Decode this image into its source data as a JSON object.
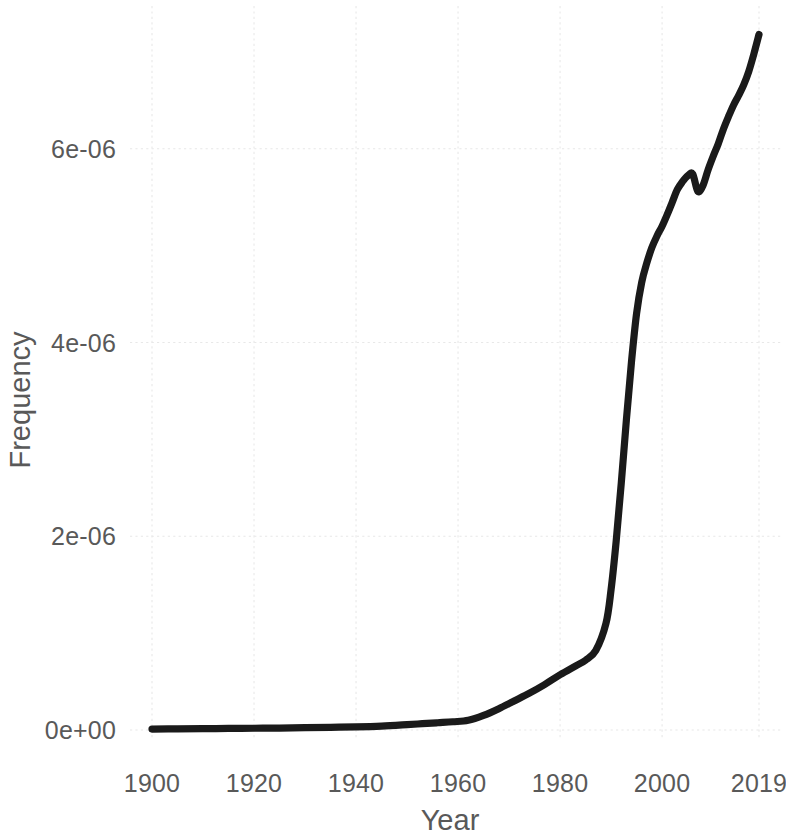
{
  "chart_data": {
    "type": "line",
    "title": "",
    "subtitle": "",
    "xlabel": "Year",
    "ylabel": "Frequency",
    "grid": true,
    "legend": false,
    "xlim": [
      1900,
      2019
    ],
    "ylim": [
      0,
      7.35e-06
    ],
    "xticks": [
      1900,
      1920,
      1940,
      1960,
      1980,
      2000,
      2019
    ],
    "xticklabels": [
      "1900",
      "1920",
      "1940",
      "1960",
      "1980",
      "2000",
      "2019"
    ],
    "yticks": [
      0,
      2e-06,
      4e-06,
      6e-06
    ],
    "yticklabels": [
      "0e+00",
      "2e-06",
      "4e-06",
      "6e-06"
    ],
    "line_color": "#1a1a1a",
    "grid_color": "#e8e8e8",
    "text_color": "#595959",
    "background_color": "#ffffff",
    "series": [
      {
        "name": "Frequency",
        "x": [
          1900,
          1905,
          1910,
          1915,
          1920,
          1925,
          1930,
          1935,
          1940,
          1945,
          1950,
          1953,
          1956,
          1959,
          1962,
          1965,
          1968,
          1971,
          1974,
          1977,
          1980,
          1983,
          1985,
          1987,
          1989,
          1990,
          1991,
          1992,
          1993,
          1994,
          1995,
          1996,
          1997,
          1998,
          1999,
          2000,
          2001,
          2002,
          2003,
          2004,
          2005,
          2006,
          2007,
          2008,
          2009,
          2010,
          2011,
          2012,
          2013,
          2014,
          2015,
          2016,
          2017,
          2018,
          2019
        ],
        "y": [
          1e-08,
          1.2e-08,
          1.4e-08,
          1.6e-08,
          1.8e-08,
          2e-08,
          2.4e-08,
          2.8e-08,
          3.2e-08,
          4e-08,
          5.5e-08,
          6.5e-08,
          7.5e-08,
          8.5e-08,
          1e-07,
          1.5e-07,
          2.2e-07,
          3e-07,
          3.8e-07,
          4.7e-07,
          5.7e-07,
          6.6e-07,
          7.2e-07,
          8.2e-07,
          1.1e-06,
          1.45e-06,
          1.95e-06,
          2.55e-06,
          3.2e-06,
          3.8e-06,
          4.3e-06,
          4.62e-06,
          4.82e-06,
          4.98e-06,
          5.1e-06,
          5.2e-06,
          5.32e-06,
          5.45e-06,
          5.58e-06,
          5.66e-06,
          5.72e-06,
          5.74e-06,
          5.56e-06,
          5.62e-06,
          5.78e-06,
          5.92e-06,
          6.05e-06,
          6.2e-06,
          6.33e-06,
          6.45e-06,
          6.55e-06,
          6.66e-06,
          6.8e-06,
          6.98e-06,
          7.18e-06
        ]
      }
    ]
  },
  "axes": {
    "x_title": "Year",
    "y_title": "Frequency"
  }
}
